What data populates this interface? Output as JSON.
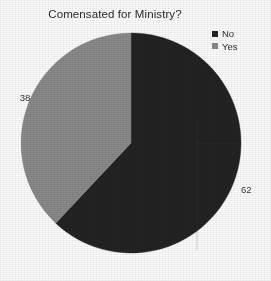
{
  "chart_data": {
    "type": "pie",
    "title": "Comensated for Ministry?",
    "xlabel": "",
    "ylabel": "",
    "categories": [
      "No",
      "Yes"
    ],
    "values": [
      62,
      38
    ],
    "slices": [
      {
        "label": "No",
        "value": 62,
        "value_text": "62",
        "color": "#232323",
        "start_angle_deg": 0,
        "sweep_deg": 223.2
      },
      {
        "label": "Yes",
        "value": 38,
        "value_text": "38",
        "color": "#8a8a8a",
        "start_angle_deg": 223.2,
        "sweep_deg": 136.8
      }
    ],
    "total": 100,
    "units": "percent",
    "grid": false,
    "legend_position": "top-right",
    "legend": [
      {
        "label": "No",
        "color": "#232323"
      },
      {
        "label": "Yes",
        "color": "#8a8a8a"
      }
    ],
    "start_angle_note": "first slice begins at 12 o'clock, sweeping clockwise",
    "geometry": {
      "center_x": 131,
      "center_y": 143,
      "radius": 110
    }
  },
  "labels": {
    "yes_value": "38",
    "no_value": "62"
  },
  "legend": {
    "items": [
      {
        "label": "No",
        "color": "#232323",
        "marker": "square-marker"
      },
      {
        "label": "Yes",
        "color": "#8a8a8a",
        "marker": "square-marker"
      }
    ]
  },
  "colors": {
    "background": "#fdfdfd",
    "no_slice": "#232323",
    "yes_slice": "#8a8a8a",
    "title_text": "#2b2b2b",
    "label_text": "#3a3a3a"
  }
}
